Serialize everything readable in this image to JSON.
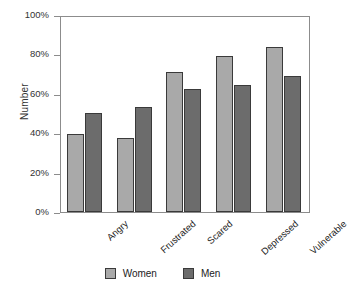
{
  "chart_data": {
    "type": "bar",
    "title": "",
    "xlabel": "",
    "ylabel": "Number",
    "categories": [
      "Angry",
      "Frustrated",
      "Scared",
      "Depressed",
      "Vulnerable"
    ],
    "series": [
      {
        "name": "Women",
        "color": "#a9a9a9",
        "values": [
          40,
          38,
          72,
          80,
          84.5
        ]
      },
      {
        "name": "Men",
        "color": "#6c6c6c",
        "values": [
          51,
          54,
          63,
          65,
          70
        ]
      }
    ],
    "ylim": [
      0,
      100
    ],
    "yticks": [
      0,
      20,
      40,
      60,
      80,
      100
    ],
    "ytick_labels": [
      "0%",
      "20%",
      "40%",
      "60%",
      "80%",
      "100%"
    ],
    "grid": false,
    "legend_position": "bottom",
    "xtick_label_rotation": -42
  },
  "axis": {
    "y_title": "Number"
  },
  "legend": {
    "items": [
      {
        "label": "Women",
        "color": "#a9a9a9"
      },
      {
        "label": "Men",
        "color": "#6c6c6c"
      }
    ]
  }
}
